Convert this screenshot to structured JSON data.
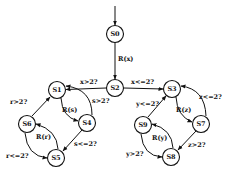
{
  "diagram": {
    "type": "state-machine",
    "nodes": [
      {
        "id": "S0",
        "label": "S0",
        "x": 115,
        "y": 34
      },
      {
        "id": "S1",
        "label": "S1",
        "x": 57,
        "y": 90
      },
      {
        "id": "S2",
        "label": "S2",
        "x": 115,
        "y": 88
      },
      {
        "id": "S3",
        "label": "S3",
        "x": 172,
        "y": 89
      },
      {
        "id": "S4",
        "label": "S4",
        "x": 87,
        "y": 123
      },
      {
        "id": "S5",
        "label": "S5",
        "x": 56,
        "y": 158
      },
      {
        "id": "S6",
        "label": "S6",
        "x": 27,
        "y": 124
      },
      {
        "id": "S7",
        "label": "S7",
        "x": 201,
        "y": 124
      },
      {
        "id": "S8",
        "label": "S8",
        "x": 171,
        "y": 157
      },
      {
        "id": "S9",
        "label": "S9",
        "x": 143,
        "y": 125
      }
    ],
    "edges": [
      {
        "from": "start",
        "to": "S0",
        "label": ""
      },
      {
        "from": "S0",
        "to": "S2",
        "label": "R(x)"
      },
      {
        "from": "S2",
        "to": "S1",
        "label": "x>2?"
      },
      {
        "from": "S2",
        "to": "S3",
        "label": "x<=2?"
      },
      {
        "from": "S1",
        "to": "S4",
        "label": "R(s)"
      },
      {
        "from": "S4",
        "to": "S1",
        "label": "s>2?"
      },
      {
        "from": "S4",
        "to": "S5",
        "label": "s<=2?"
      },
      {
        "from": "S5",
        "to": "S6",
        "label": "R(r)"
      },
      {
        "from": "S6",
        "to": "S1",
        "label": "r>2?"
      },
      {
        "from": "S6",
        "to": "S5",
        "label": "r<=2?"
      },
      {
        "from": "S3",
        "to": "S7",
        "label": "R(z)"
      },
      {
        "from": "S7",
        "to": "S3",
        "label": "z<=2?"
      },
      {
        "from": "S7",
        "to": "S8",
        "label": "z>2?"
      },
      {
        "from": "S8",
        "to": "S9",
        "label": "R(y)"
      },
      {
        "from": "S9",
        "to": "S3",
        "label": "y<=2?"
      },
      {
        "from": "S9",
        "to": "S8",
        "label": "y>2?"
      }
    ]
  },
  "labels": {
    "S0": "S0",
    "S1": "S1",
    "S2": "S2",
    "S3": "S3",
    "S4": "S4",
    "S5": "S5",
    "S6": "S6",
    "S7": "S7",
    "S8": "S8",
    "S9": "S9",
    "e_S0_S2": "R(x)",
    "e_S2_S1": "x>2?",
    "e_S2_S3": "x<=2?",
    "e_S1_S4": "R(s)",
    "e_S4_S1": "s>2?",
    "e_S4_S5": "s<=2?",
    "e_S5_S6": "R(r)",
    "e_S6_S1": "r>2?",
    "e_S6_S5": "r<=2?",
    "e_S3_S7": "R(z)",
    "e_S7_S3": "z<=2?",
    "e_S7_S8": "z>2?",
    "e_S8_S9": "R(y)",
    "e_S9_S3": "y<=2?",
    "e_S9_S8": "y>2?"
  }
}
